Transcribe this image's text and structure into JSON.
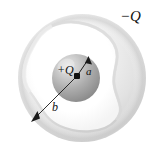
{
  "figure": {
    "background_color": "#ffffff",
    "width": 158,
    "height": 155,
    "labels": {
      "outer_charge": "−Q",
      "inner_charge": "+Q",
      "inner_radius": "a",
      "outer_radius": "b"
    },
    "icon_names": {
      "outer_sphere": "outer-sphere-shading",
      "cavity": "irregular-cavity",
      "inner_sphere": "inner-charged-sphere",
      "radius_a_arrow": "radius-a-arrow-icon",
      "radius_b_arrow": "radius-b-arrow-icon",
      "center_dot": "center-point-charge-dot"
    },
    "colors": {
      "outer_sphere_light": "#f2f2f2",
      "outer_sphere_mid": "#e0e0e0",
      "outer_sphere_dark": "#c8c8c8",
      "cavity_fill": "#ffffff",
      "inner_sphere_light": "#d8d8d8",
      "inner_sphere_mid": "#a8a8a8",
      "inner_sphere_dark": "#8a8a8a",
      "line_color": "#1a1a1a",
      "text_color": "#111111"
    },
    "geometry": {
      "outer_sphere_center": [
        82,
        78
      ],
      "outer_sphere_radius": 64,
      "inner_sphere_center": [
        76,
        78
      ],
      "inner_sphere_radius": 24,
      "center_dot": [
        77,
        76
      ],
      "radius_a_arrow_tip": [
        88,
        57
      ],
      "radius_b_arrow_tip": [
        33,
        120
      ]
    }
  }
}
